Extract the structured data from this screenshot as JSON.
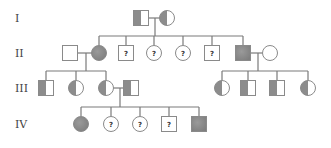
{
  "colors": {
    "affected": "#8c8c8c",
    "unaffected": "#ffffff",
    "outline": "#8a8a8a",
    "line": "#7a7a7a"
  },
  "generations": [
    {
      "label": "I",
      "y": 18
    },
    {
      "label": "II",
      "y": 53
    },
    {
      "label": "III",
      "y": 88
    },
    {
      "label": "IV",
      "y": 124
    }
  ],
  "individuals": [
    {
      "id": "I-1",
      "gen": 0,
      "x": 141,
      "sex": "male",
      "status": "carrier"
    },
    {
      "id": "I-2",
      "gen": 0,
      "x": 167,
      "sex": "female",
      "status": "carrier"
    },
    {
      "id": "II-1",
      "gen": 1,
      "x": 70,
      "sex": "male",
      "status": "unaffected"
    },
    {
      "id": "II-2",
      "gen": 1,
      "x": 99,
      "sex": "female",
      "status": "affected"
    },
    {
      "id": "II-3",
      "gen": 1,
      "x": 126,
      "sex": "male",
      "status": "unknown",
      "mark": "?"
    },
    {
      "id": "II-4",
      "gen": 1,
      "x": 154,
      "sex": "female",
      "status": "unknown",
      "mark": "?"
    },
    {
      "id": "II-5",
      "gen": 1,
      "x": 183,
      "sex": "female",
      "status": "unknown",
      "mark": "?"
    },
    {
      "id": "II-6",
      "gen": 1,
      "x": 212,
      "sex": "male",
      "status": "unknown",
      "mark": "?"
    },
    {
      "id": "II-7",
      "gen": 1,
      "x": 243,
      "sex": "male",
      "status": "affected"
    },
    {
      "id": "II-8",
      "gen": 1,
      "x": 270,
      "sex": "female",
      "status": "unaffected"
    },
    {
      "id": "III-1",
      "gen": 2,
      "x": 46,
      "sex": "male",
      "status": "carrier"
    },
    {
      "id": "III-2",
      "gen": 2,
      "x": 76,
      "sex": "female",
      "status": "carrier"
    },
    {
      "id": "III-3",
      "gen": 2,
      "x": 106,
      "sex": "female",
      "status": "carrier"
    },
    {
      "id": "III-4",
      "gen": 2,
      "x": 131,
      "sex": "male",
      "status": "carrier"
    },
    {
      "id": "III-5",
      "gen": 2,
      "x": 222,
      "sex": "female",
      "status": "carrier"
    },
    {
      "id": "III-6",
      "gen": 2,
      "x": 248,
      "sex": "male",
      "status": "carrier"
    },
    {
      "id": "III-7",
      "gen": 2,
      "x": 277,
      "sex": "male",
      "status": "carrier"
    },
    {
      "id": "III-8",
      "gen": 2,
      "x": 308,
      "sex": "female",
      "status": "carrier"
    },
    {
      "id": "IV-1",
      "gen": 3,
      "x": 81,
      "sex": "female",
      "status": "affected"
    },
    {
      "id": "IV-2",
      "gen": 3,
      "x": 111,
      "sex": "female",
      "status": "unknown",
      "mark": "?"
    },
    {
      "id": "IV-3",
      "gen": 3,
      "x": 140,
      "sex": "female",
      "status": "unknown",
      "mark": "?"
    },
    {
      "id": "IV-4",
      "gen": 3,
      "x": 169,
      "sex": "male",
      "status": "unknown",
      "mark": "?"
    },
    {
      "id": "IV-5",
      "gen": 3,
      "x": 199,
      "sex": "male",
      "status": "affected"
    }
  ],
  "couples": [
    {
      "a": "I-1",
      "b": "I-2",
      "dropX": 155,
      "children": [
        "II-2",
        "II-3",
        "II-4",
        "II-5",
        "II-6",
        "II-7"
      ]
    },
    {
      "a": "II-1",
      "b": "II-2",
      "dropX": 86,
      "children": [
        "III-1",
        "III-2",
        "III-3"
      ]
    },
    {
      "a": "II-7",
      "b": "II-8",
      "dropX": 258,
      "children": [
        "III-5",
        "III-6",
        "III-7",
        "III-8"
      ]
    },
    {
      "a": "III-3",
      "b": "III-4",
      "dropX": 120,
      "children": [
        "IV-1",
        "IV-2",
        "IV-3",
        "IV-4",
        "IV-5"
      ]
    }
  ],
  "legend": {
    "affected": "shaded",
    "carrier": "half-shaded",
    "unaffected": "unshaded",
    "unknown": "?"
  }
}
